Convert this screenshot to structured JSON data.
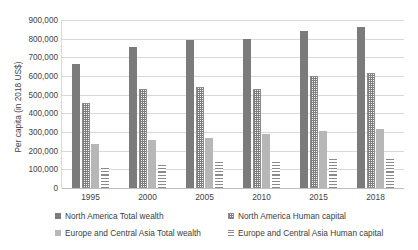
{
  "chart_data": {
    "type": "bar",
    "title": "",
    "subtitle": "",
    "xlabel": "",
    "ylabel": "Per capita (in 2018 US$)",
    "categories": [
      "1995",
      "2000",
      "2005",
      "2010",
      "2015",
      "2018"
    ],
    "ylim": [
      0,
      900000
    ],
    "ytick_values": [
      0,
      100000,
      200000,
      300000,
      400000,
      500000,
      600000,
      700000,
      800000,
      900000
    ],
    "ytick_labels": [
      "0",
      "100,000",
      "200,000",
      "300,000",
      "400,000",
      "500,000",
      "600,000",
      "700,000",
      "800,000",
      "900,000"
    ],
    "grid": true,
    "legend_position": "bottom",
    "series": [
      {
        "name": "North America Total wealth",
        "pattern": "solid-dark",
        "color": "#7b7b7b",
        "values": [
          665000,
          755000,
          795000,
          800000,
          840000,
          860000
        ]
      },
      {
        "name": "North America Human capital",
        "pattern": "checkered",
        "color": "#8c8c8c",
        "values": [
          455000,
          530000,
          540000,
          530000,
          600000,
          615000
        ]
      },
      {
        "name": "Europe and Central Asia Total wealth",
        "pattern": "solid-light",
        "color": "#b7b7b7",
        "values": [
          235000,
          255000,
          270000,
          290000,
          305000,
          315000
        ]
      },
      {
        "name": "Europe and Central Asia Human capital",
        "pattern": "horizontal-stripes",
        "color": "#8a8a8a",
        "values": [
          115000,
          130000,
          140000,
          150000,
          160000,
          165000
        ]
      }
    ]
  }
}
